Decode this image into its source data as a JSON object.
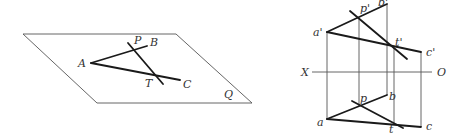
{
  "figure_left": {
    "title": "Spatial view",
    "plane_label": "Q",
    "points": {
      "A": {
        "label": "A",
        "x": 91,
        "y": 63
      },
      "B": {
        "label": "B",
        "x": 147,
        "y": 46
      },
      "C": {
        "label": "C",
        "x": 180,
        "y": 80
      },
      "P": {
        "label": "P",
        "x": 133,
        "y": 51
      },
      "T": {
        "label": "T",
        "x": 155,
        "y": 76
      }
    },
    "plane_corners": [
      [
        23,
        34
      ],
      [
        176,
        34
      ],
      [
        252,
        103
      ],
      [
        97,
        103
      ]
    ],
    "line_PT_ends": [
      [
        128,
        43
      ],
      [
        163,
        84
      ]
    ]
  },
  "figure_right": {
    "title": "Orthographic projection",
    "axis": {
      "left_label": "X",
      "right_label": "O",
      "y": 72
    },
    "front_view": {
      "a": {
        "label": "a'",
        "x": 327,
        "y": 32
      },
      "b": {
        "label": "b'",
        "x": 387,
        "y": 4
      },
      "c": {
        "label": "c'",
        "x": 421,
        "y": 52
      },
      "p": {
        "label": "p'",
        "x": 359,
        "y": 18
      },
      "t": {
        "label": "t'",
        "x": 394,
        "y": 48
      }
    },
    "top_view": {
      "a": {
        "label": "a",
        "x": 327,
        "y": 119
      },
      "b": {
        "label": "b",
        "x": 387,
        "y": 95
      },
      "c": {
        "label": "c",
        "x": 421,
        "y": 127
      },
      "p": {
        "label": "p",
        "x": 359,
        "y": 106
      },
      "t": {
        "label": "t",
        "x": 394,
        "y": 123
      }
    }
  }
}
